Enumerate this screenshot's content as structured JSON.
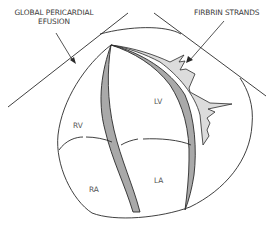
{
  "figure": {
    "type": "echocardiography schematic",
    "view": "apical four-chamber"
  },
  "annotations": {
    "left_callout_line1": "GLOBAL PERICARDIAL",
    "left_callout_line2": "EFUSION",
    "right_callout": "FIRBRIN STRANDS"
  },
  "chambers": {
    "lv": "LV",
    "rv": "RV",
    "ra": "RA",
    "la": "LA"
  },
  "colors": {
    "outline": "#2a2a2a",
    "septum_fill": "#a9a9a9",
    "fibrin_fill": "#dcdcdc",
    "text": "#3a3a3a",
    "background": "#ffffff"
  }
}
